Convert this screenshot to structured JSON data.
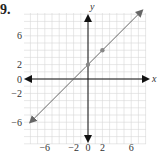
{
  "problem": {
    "number": "9."
  },
  "colors": {
    "grid": "#d6d6d6",
    "axis": "#111111",
    "line": "#666666",
    "point": "#888888"
  },
  "chart_data": {
    "type": "line",
    "title": "",
    "xlabel": "x",
    "ylabel": "y",
    "xlim": [
      -8.5,
      8
    ],
    "ylim": [
      -9,
      9
    ],
    "grid": true,
    "x_ticks": [
      {
        "value": -6,
        "label": "−6"
      },
      {
        "value": -2,
        "label": "−2"
      },
      {
        "value": 0,
        "label": "0"
      },
      {
        "value": 2,
        "label": "2"
      },
      {
        "value": 6,
        "label": "6"
      }
    ],
    "y_ticks": [
      {
        "value": 6,
        "label": "6"
      },
      {
        "value": 2,
        "label": "2"
      },
      {
        "value": 0,
        "label": "0"
      },
      {
        "value": -2,
        "label": "−2"
      },
      {
        "value": -6,
        "label": "−6"
      }
    ],
    "series": [
      {
        "name": "y = x + 2",
        "equation": "y = x + 2",
        "x": [
          -8,
          7.5
        ],
        "y": [
          -6,
          9.5
        ],
        "arrows_both_ends": true
      }
    ],
    "points": [
      {
        "x": 0,
        "y": 2
      },
      {
        "x": 2,
        "y": 4
      }
    ]
  }
}
